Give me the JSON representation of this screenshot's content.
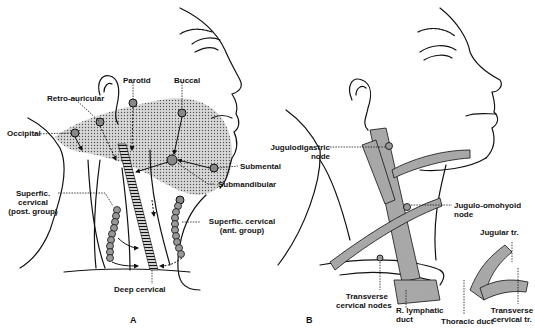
{
  "figure": {
    "panels": [
      {
        "id": "A",
        "letter": "A",
        "description": "Lymph node groups of the head and neck with drainage arrows",
        "labels": {
          "retro_auricular": "Retro-auricular",
          "parotid": "Parotid",
          "buccal": "Buccal",
          "occipital": "Occipital",
          "submental": "Submental",
          "submandibular": "Submandibular",
          "superf_cervical_post_1": "Superfic.",
          "superf_cervical_post_2": "cervical",
          "superf_cervical_post_3": "(post. group)",
          "superf_cervical_ant_1": "Superfic. cervical",
          "superf_cervical_ant_2": "(ant. group)",
          "deep_cervical": "Deep cervical"
        }
      },
      {
        "id": "B",
        "letter": "B",
        "description": "Deep cervical lymph nodes and lymphatic ducts",
        "labels": {
          "jugulodigastric_1": "Jugulodigastric",
          "jugulodigastric_2": "node",
          "jugulo_omohyoid_1": "Jugulo-omohyoid",
          "jugulo_omohyoid_2": "node",
          "jugular_tr": "Jugular tr.",
          "transverse_cervical_nodes_1": "Transverse",
          "transverse_cervical_nodes_2": "cervical nodes",
          "r_lymphatic_duct_1": "R. lymphatic",
          "r_lymphatic_duct_2": "duct",
          "thoracic_duct": "Thoracic duct",
          "transverse_cervical_tr_1": "Transverse",
          "transverse_cervical_tr_2": "cervical tr."
        }
      }
    ]
  }
}
